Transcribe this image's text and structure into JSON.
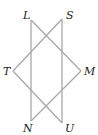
{
  "diagram": {
    "type": "geometry-figure",
    "line_color": "#a8a8a8",
    "label_color": "#222222",
    "points": [
      {
        "name": "L",
        "x": 31,
        "y": 20,
        "label_x": 23,
        "label_y": 19
      },
      {
        "name": "S",
        "x": 62,
        "y": 19,
        "label_x": 66,
        "label_y": 19
      },
      {
        "name": "T",
        "x": 13,
        "y": 71,
        "label_x": 3,
        "label_y": 75
      },
      {
        "name": "M",
        "x": 81,
        "y": 71,
        "label_x": 84,
        "label_y": 75
      },
      {
        "name": "N",
        "x": 31,
        "y": 121,
        "label_x": 23,
        "label_y": 132
      },
      {
        "name": "U",
        "x": 62,
        "y": 123,
        "label_x": 65,
        "label_y": 132
      }
    ],
    "segments": [
      [
        "L",
        "N"
      ],
      [
        "S",
        "U"
      ],
      [
        "L",
        "M"
      ],
      [
        "T",
        "S"
      ],
      [
        "T",
        "U"
      ],
      [
        "M",
        "N"
      ]
    ]
  }
}
